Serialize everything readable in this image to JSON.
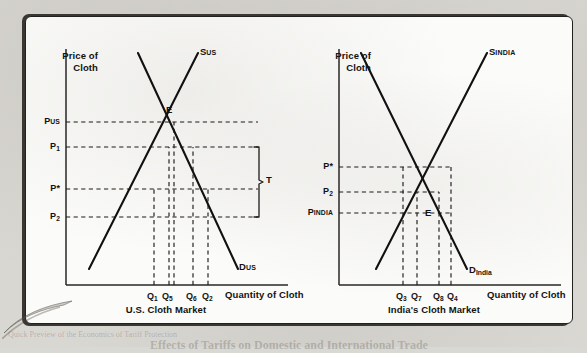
{
  "figure": {
    "background_color": "#d9d7d2",
    "panel_color": "#fbfbf9",
    "ink_color": "#111111"
  },
  "charts": [
    {
      "id": "us",
      "caption": "U.S. Cloth Market",
      "y_axis_title_line1": "Price of",
      "y_axis_title_line2": "Cloth",
      "x_axis_title": "Quantity of Cloth",
      "supply_label_main": "S",
      "supply_label_sub": "US",
      "demand_label_main": "D",
      "demand_label_sub": "US",
      "equilibrium_point": "E",
      "bracket_label": "T",
      "price_ticks": [
        {
          "main": "P",
          "sub": "US"
        },
        {
          "main": "P",
          "sub": "1"
        },
        {
          "main": "P*",
          "sub": ""
        },
        {
          "main": "P",
          "sub": "2"
        }
      ],
      "quantity_ticks": [
        {
          "main": "Q",
          "sub": "1"
        },
        {
          "main": "Q",
          "sub": "5"
        },
        {
          "main": "Q",
          "sub": "6"
        },
        {
          "main": "Q",
          "sub": "2"
        }
      ]
    },
    {
      "id": "india",
      "caption": "India's Cloth Market",
      "y_axis_title_line1": "Price of",
      "y_axis_title_line2": "Cloth",
      "x_axis_title": "Quantity of Cloth",
      "supply_label_main": "S",
      "supply_label_sub": "INDIA",
      "demand_label_main": "D",
      "demand_label_sub": "India",
      "equilibrium_point": "E",
      "price_ticks": [
        {
          "main": "P*",
          "sub": ""
        },
        {
          "main": "P",
          "sub": "2"
        },
        {
          "main": "P",
          "sub": "INDIA"
        }
      ],
      "quantity_ticks": [
        {
          "main": "Q",
          "sub": "3"
        },
        {
          "main": "Q",
          "sub": "7"
        },
        {
          "main": "Q",
          "sub": "8"
        },
        {
          "main": "Q",
          "sub": "4"
        }
      ]
    }
  ],
  "ghost_text": [
    {
      "text": "cloth goods",
      "x": 492,
      "y": 26,
      "size": 9,
      "weight": "700"
    },
    {
      "text": "abroad",
      "x": 496,
      "y": 38,
      "size": 9,
      "weight": "400"
    },
    {
      "text": "taxation",
      "x": 494,
      "y": 50,
      "size": 9,
      "weight": "400"
    },
    {
      "text": "damages",
      "x": 493,
      "y": 62,
      "size": 9,
      "weight": "400"
    },
    {
      "text": "large",
      "x": 500,
      "y": 74,
      "size": 10,
      "weight": "700"
    },
    {
      "text": "charging",
      "x": 494,
      "y": 86,
      "size": 9,
      "weight": "400"
    },
    {
      "text": "economy",
      "x": 494,
      "y": 98,
      "size": 9,
      "weight": "400"
    },
    {
      "text": "inequitable",
      "x": 491,
      "y": 110,
      "size": 9,
      "weight": "400"
    },
    {
      "text": "at least",
      "x": 497,
      "y": 122,
      "size": 9,
      "weight": "400"
    },
    {
      "text": "SUMMARY",
      "x": 470,
      "y": 156,
      "size": 12,
      "weight": "700"
    },
    {
      "text": "world that are not normally exported",
      "x": 104,
      "y": 32,
      "size": 10,
      "weight": "400"
    },
    {
      "text": "countries dumping their factors in reaction",
      "x": 70,
      "y": 58,
      "size": 10,
      "weight": "400"
    },
    {
      "text": "determine the fairness of the price",
      "x": 74,
      "y": 70,
      "size": 10,
      "weight": "400"
    },
    {
      "text": "support whose import is not in conflict",
      "x": 70,
      "y": 82,
      "size": 10,
      "weight": "400"
    },
    {
      "text": "during the period in which strategic",
      "x": 72,
      "y": 94,
      "size": 10,
      "weight": "400"
    },
    {
      "text": "governments arrive when the country",
      "x": 70,
      "y": 106,
      "size": 10,
      "weight": "400"
    },
    {
      "text": "they are able to find value of",
      "x": 320,
      "y": 30,
      "size": 10,
      "weight": "400"
    },
    {
      "text": "tries for just this reason",
      "x": 322,
      "y": 42,
      "size": 10,
      "weight": "400"
    },
    {
      "text": "Thus, the goals of multi-term",
      "x": 326,
      "y": 54,
      "size": 10,
      "weight": "400"
    },
    {
      "text": "importantly, goods of the similar",
      "x": 320,
      "y": 66,
      "size": 10,
      "weight": "400"
    },
    {
      "text": "chances. Most domestic goods are",
      "x": 318,
      "y": 78,
      "size": 10,
      "weight": "400"
    },
    {
      "text": "tax-producers is a fairly predictable",
      "x": 318,
      "y": 90,
      "size": 10,
      "weight": "400"
    },
    {
      "text": "were used in the production sense",
      "x": 320,
      "y": 102,
      "size": 10,
      "weight": "400"
    },
    {
      "text": "quantity",
      "x": 392,
      "y": 116,
      "size": 10,
      "weight": "400"
    },
    {
      "text": "the value of the goods in",
      "x": 470,
      "y": 172,
      "size": 9,
      "weight": "400"
    },
    {
      "text": "domestic quantities",
      "x": 472,
      "y": 184,
      "size": 9,
      "weight": "400"
    },
    {
      "text": "trade in the tariff",
      "x": 474,
      "y": 196,
      "size": 9,
      "weight": "400"
    },
    {
      "text": "production",
      "x": 70,
      "y": 212,
      "size": 9,
      "weight": "400"
    },
    {
      "text": "rates in the",
      "x": 68,
      "y": 224,
      "size": 9,
      "weight": "400"
    },
    {
      "text": "value of trade",
      "x": 66,
      "y": 236,
      "size": 9,
      "weight": "400"
    },
    {
      "text": "Effects of Tariffs on Domestic and International Trade",
      "x": 150,
      "y": 338,
      "size": 12,
      "weight": "700"
    },
    {
      "text": "Quick Preview of the Economics of Tariff Protection",
      "x": 8,
      "y": 330,
      "size": 8,
      "weight": "400"
    }
  ],
  "geometry": {
    "us": {
      "origin_x": 40,
      "origin_y": 268,
      "axis_top": 32,
      "axis_right": 262,
      "supply": {
        "x1": 63,
        "y1": 252,
        "x2": 172,
        "y2": 36
      },
      "demand": {
        "x1": 112,
        "y1": 36,
        "x2": 212,
        "y2": 252
      },
      "price_levels": [
        105,
        130,
        172,
        200
      ],
      "quantity_positions": [
        128,
        143,
        167,
        182
      ],
      "equilibrium": {
        "x": 148,
        "y": 105
      },
      "bracket_x": 232,
      "bracket_top": 130,
      "bracket_bottom": 200
    },
    "india": {
      "origin_x": 40,
      "origin_y": 268,
      "axis_top": 32,
      "axis_right": 262,
      "supply": {
        "x1": 77,
        "y1": 252,
        "x2": 188,
        "y2": 36
      },
      "demand": {
        "x1": 62,
        "y1": 36,
        "x2": 168,
        "y2": 252
      },
      "price_levels": [
        150,
        175,
        196
      ],
      "quantity_positions": [
        104,
        118,
        140,
        152
      ],
      "equilibrium": {
        "x": 125,
        "y": 200
      }
    }
  }
}
